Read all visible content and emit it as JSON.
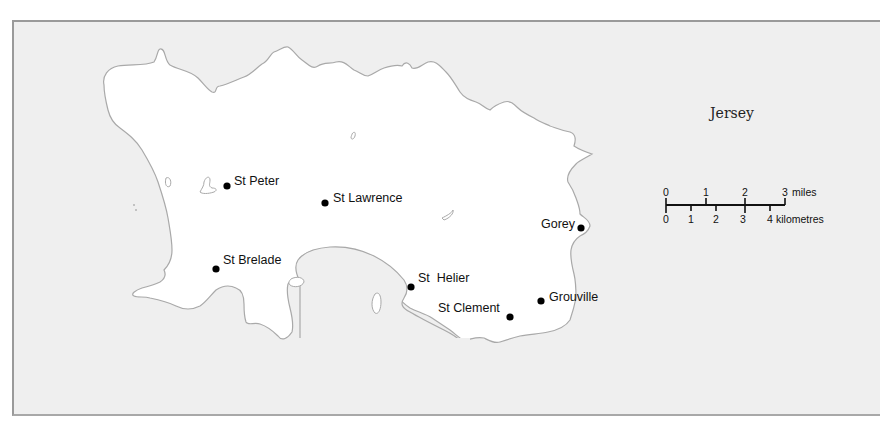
{
  "map": {
    "title": "Jersey",
    "colors": {
      "sea": "#efefef",
      "land": "#ffffff",
      "coastline": "#a9a9a9",
      "marker": "#000000",
      "frame_border": "#9a9a9a"
    },
    "places": [
      {
        "name": "St Peter",
        "x": 227,
        "y": 186,
        "label_x": 234,
        "label_y": 185
      },
      {
        "name": "St Lawrence",
        "x": 325,
        "y": 203,
        "label_x": 333,
        "label_y": 202
      },
      {
        "name": "Gorey",
        "x": 581,
        "y": 228,
        "label_x": 541,
        "label_y": 228
      },
      {
        "name": "St Brelade",
        "x": 216,
        "y": 269,
        "label_x": 223,
        "label_y": 264
      },
      {
        "name": "St  Helier",
        "x": 411,
        "y": 287,
        "label_x": 418,
        "label_y": 282
      },
      {
        "name": "Grouville",
        "x": 541,
        "y": 301,
        "label_x": 549,
        "label_y": 301
      },
      {
        "name": "St Clement",
        "x": 510,
        "y": 317,
        "label_x": 438,
        "label_y": 312
      }
    ],
    "scale_bar": {
      "miles_label": "miles",
      "kilometres_label": "kilometres",
      "miles_ticks": [
        "0",
        "1",
        "2",
        "3"
      ],
      "kilometre_ticks": [
        "0",
        "1",
        "2",
        "3",
        "4"
      ]
    }
  }
}
